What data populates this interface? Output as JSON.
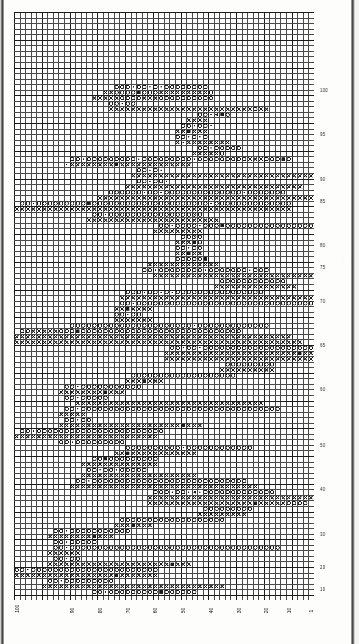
{
  "document": {
    "type": "cross-stitch-chart",
    "title": "Filet crochet / cross stitch pattern chart"
  },
  "chart_data": {
    "type": "heatmap",
    "xlabel": "",
    "ylabel": "",
    "grid": true,
    "legend_position": "none",
    "columns": 54,
    "rows": 106,
    "cell_px": 5.55,
    "bold_every": 5,
    "symbols": {
      "o": "open-circle",
      "x": "cross",
      "f": "filled-square",
      "t": "triangle",
      "d": "dot"
    },
    "colors": {
      "grid_line": "#4a4a4a",
      "grid_line_bold": "#1c1c1c",
      "symbol": "#1a1a1a",
      "paper": "#ffffff"
    },
    "x_ticks": [
      {
        "col": 0,
        "label": "100"
      },
      {
        "col": 10,
        "label": "90"
      },
      {
        "col": 15,
        "label": "80"
      },
      {
        "col": 20,
        "label": "70"
      },
      {
        "col": 25,
        "label": "60"
      },
      {
        "col": 30,
        "label": "50"
      },
      {
        "col": 35,
        "label": "40"
      },
      {
        "col": 40,
        "label": "30"
      },
      {
        "col": 45,
        "label": "20"
      },
      {
        "col": 49,
        "label": "10"
      },
      {
        "col": 53,
        "label": "1"
      }
    ],
    "y_ticks": [
      {
        "row": 14,
        "label": "100"
      },
      {
        "row": 22,
        "label": "95"
      },
      {
        "row": 30,
        "label": "90"
      },
      {
        "row": 34,
        "label": "85"
      },
      {
        "row": 42,
        "label": "80"
      },
      {
        "row": 46,
        "label": "75"
      },
      {
        "row": 52,
        "label": "70"
      },
      {
        "row": 60,
        "label": "65"
      },
      {
        "row": 68,
        "label": "60"
      },
      {
        "row": 78,
        "label": "50"
      },
      {
        "row": 86,
        "label": "40"
      },
      {
        "row": 94,
        "label": "30"
      },
      {
        "row": 100,
        "label": "20"
      },
      {
        "row": 104,
        "label": "10"
      }
    ],
    "cells": [
      {
        "r": 13,
        "c": 18,
        "s": "ooo-oo-o-oooooooo"
      },
      {
        "r": 14,
        "c": 16,
        "s": "xxoooofoooxxxxxxxxxo"
      },
      {
        "r": 15,
        "c": 14,
        "s": "xxxxxooooxxxoooooooooo"
      },
      {
        "r": 16,
        "c": 17,
        "s": "oo-oo"
      },
      {
        "r": 17,
        "c": 17,
        "s": "xxxxxxxxxxxxxxxxxxxxxxxxxxoxx"
      },
      {
        "r": 18,
        "c": 33,
        "s": "oo-tfo"
      },
      {
        "r": 19,
        "c": 31,
        "s": "xxxx"
      },
      {
        "r": 20,
        "c": 30,
        "s": "oo-oo-"
      },
      {
        "r": 21,
        "c": 29,
        "s": "xxfxxx"
      },
      {
        "r": 22,
        "c": 29,
        "s": "oo-o-o"
      },
      {
        "r": 23,
        "c": 29,
        "s": "x-xxxxxxxx"
      },
      {
        "r": 24,
        "c": 33,
        "s": "oo-ooooo"
      },
      {
        "r": 25,
        "c": 32,
        "s": "xxxxxo"
      },
      {
        "r": 26,
        "c": 10,
        "s": "oo-ooooooooo-ooooooooo-oooooooooxxxooofo"
      },
      {
        "r": 27,
        "c": 9,
        "s": "-xxxxxxxxfxxxxxxxxxxxxx"
      },
      {
        "r": 28,
        "c": 22,
        "s": "oo-o-"
      },
      {
        "r": 29,
        "c": 21,
        "s": "xxxxxxxxxxxxxxxxxxxxxxxxxxxxxxxxx"
      },
      {
        "r": 30,
        "c": 22,
        "s": "oo-oo-"
      },
      {
        "r": 31,
        "c": 20,
        "s": "xxxxxxxxxxxxxxxxxxxxxxxxxxxxxxxx"
      },
      {
        "r": 32,
        "c": 17,
        "s": "oooooo-oo-oooooooooooooo-ooooooo"
      },
      {
        "r": 33,
        "c": 15,
        "s": "xxxxxxxxxxxxxxxxxxxxxxxxxxxxxxxxxxxxxxxxx"
      },
      {
        "r": 34,
        "c": 1,
        "s": "oo-ooooooooofooooooooooooooooooooo-oooooooooooooo"
      },
      {
        "r": 35,
        "c": 0,
        "s": "xxxxxxxxxxxxxxxxxxxxxxxxxxxxxxxxxxxxxxxxxxxxxxxxxx"
      },
      {
        "r": 36,
        "c": 14,
        "s": "oo-ooooooooooooooouo"
      },
      {
        "r": 37,
        "c": 13,
        "s": "xxxxxxxxxxxxxxxxxxxxxxxx"
      },
      {
        "r": 38,
        "c": 26,
        "s": "oo-oooo-ooofooooooooooooooooofooo"
      },
      {
        "r": 39,
        "c": 25,
        "s": "xxxxxxxxx"
      },
      {
        "r": 40,
        "c": 30,
        "s": "oouo"
      },
      {
        "r": 41,
        "c": 29,
        "s": "xxxfo"
      },
      {
        "r": 42,
        "c": 29,
        "s": "oo-oo"
      },
      {
        "r": 43,
        "c": 29,
        "s": "xxfxx"
      },
      {
        "r": 44,
        "c": 29,
        "s": "ooooof"
      },
      {
        "r": 45,
        "c": 24,
        "s": "xxxxxxxxxxxxx"
      },
      {
        "r": 46,
        "c": 23,
        "s": "oo-oooooooo-ooooooo-ooo"
      },
      {
        "r": 47,
        "c": 25,
        "s": "xxxxxxxxxxxxxxxxxxxxxxxxxxxxxx"
      },
      {
        "r": 48,
        "c": 37,
        "s": "oooooooooooo"
      },
      {
        "r": 49,
        "c": 36,
        "s": "xxxxxxxxxxxxxxx"
      },
      {
        "r": 50,
        "c": 20,
        "s": "ooo-oo-o-oooooooooooooooo"
      },
      {
        "r": 51,
        "c": 19,
        "s": "xxxxxxxxxxxxxxxxxxxxxxxxxxxxxxxxxxxxxxxxxxxxxxx"
      },
      {
        "r": 52,
        "c": 19,
        "s": "oo-oooooooooooooooooooooooooooooooooooooooooo"
      },
      {
        "r": 53,
        "c": 18,
        "s": "xxfxxxx"
      },
      {
        "r": 54,
        "c": 18,
        "s": "oo-oo"
      },
      {
        "r": 55,
        "c": 18,
        "s": "xxxxxxx"
      },
      {
        "r": 56,
        "c": 10,
        "s": "oooooooooooooooooooooo-ooooooooooooo"
      },
      {
        "r": 57,
        "c": 1,
        "s": "ooxxxxxooofooooooooooooooooooooooooooooo"
      },
      {
        "r": 58,
        "c": 0,
        "s": "xxxxxxxxxxxxxxxxxxxxxxxxxxxxxxxxxxxxxxxxxxxxxxxxxx"
      },
      {
        "r": 59,
        "c": 0,
        "s": "xxxxxxxxxxxxxxxxxxxxxxxxxxxxxxxxxxxxxxxxxxxxxxxxxxxx"
      },
      {
        "r": 60,
        "c": 28,
        "s": "oo-oo-ooooooooooooooooooooooooo-ooo"
      },
      {
        "r": 61,
        "c": 27,
        "s": "xxxxxxxxxxxxxxxxxxxxxxxxfxxxxxo"
      },
      {
        "r": 62,
        "c": 27,
        "s": "xxxxxxxxxxxxxxxxxxxxxxxxxxxxx"
      },
      {
        "r": 63,
        "c": 38,
        "s": "ooooooooo"
      },
      {
        "r": 64,
        "c": 37,
        "s": "xxxxxxxxxx"
      },
      {
        "r": 65,
        "c": 21,
        "s": "ooooooooooooooooooo"
      },
      {
        "r": 66,
        "c": 20,
        "s": "xxxfxxx"
      },
      {
        "r": 67,
        "c": 9,
        "s": "oo-ooooooooooo"
      },
      {
        "r": 68,
        "c": 8,
        "s": "xxxxxxxxfxxx"
      },
      {
        "r": 69,
        "c": 9,
        "s": "oo-ooooo"
      },
      {
        "r": 70,
        "c": 11,
        "s": "xxxxxxxxxxxxxxxxxxxxxxxxxxxxxxxxxx"
      },
      {
        "r": 71,
        "c": 9,
        "s": "oo-oooooooooooooooooooooooooooooooooooo"
      },
      {
        "r": 72,
        "c": 8,
        "s": "xxxxx"
      },
      {
        "r": 73,
        "c": 9,
        "s": "oo-oo"
      },
      {
        "r": 74,
        "c": 8,
        "s": "xxxxxxxxxxxxxxxxxxxxxxfxxx"
      },
      {
        "r": 75,
        "c": 1,
        "s": "oo-ooooooooooooooooooooooo"
      },
      {
        "r": 76,
        "c": 0,
        "s": "xxxxxxxxxxxxxxxxxxxxxxxxxx"
      },
      {
        "r": 77,
        "c": 8,
        "s": "oo-ooooooooo"
      },
      {
        "r": 78,
        "c": 20,
        "s": "oooooooooo-oooooooooooo"
      },
      {
        "r": 79,
        "c": 18,
        "s": "xxfxxxxxxxxxxxx"
      },
      {
        "r": 80,
        "c": 14,
        "s": "oofooooooooo"
      },
      {
        "r": 81,
        "c": 12,
        "s": "xxxxxxxxxxxxxx"
      },
      {
        "r": 82,
        "c": 13,
        "s": "oo-oo-ooooo"
      },
      {
        "r": 83,
        "c": 12,
        "s": "xxxxxxxxxxxxxxxxxxxxx"
      },
      {
        "r": 84,
        "c": 11,
        "s": "oo-oooooooooooooooooooooooooooo"
      },
      {
        "r": 85,
        "c": 10,
        "s": "xxxxxxxxxxxxxxxxxxxxxxxxxxxxxxxxxx"
      },
      {
        "r": 86,
        "c": 25,
        "s": "ooo-oo-t-ooooooooooooo"
      },
      {
        "r": 87,
        "c": 24,
        "s": "xxxxxxxxxxxxxxxxxxxxxxxxxxxxxx"
      },
      {
        "r": 88,
        "c": 24,
        "s": "xxxxxxxxxxxxxxxxxxxfxxxxxoooo"
      },
      {
        "r": 89,
        "c": 34,
        "s": "ooooooooo"
      },
      {
        "r": 90,
        "c": 33,
        "s": "xxxxxxxxx"
      },
      {
        "r": 91,
        "c": 19,
        "s": "ooooooooooooooooooo"
      },
      {
        "r": 92,
        "c": 18,
        "s": "xxxfxxx"
      },
      {
        "r": 93,
        "c": 7,
        "s": "oo-ooooooooooo"
      },
      {
        "r": 94,
        "c": 6,
        "s": "xxxxxxxxfxxx"
      },
      {
        "r": 95,
        "c": 7,
        "s": "oo-ooooo"
      },
      {
        "r": 96,
        "c": 7,
        "s": "oo-oooooooooooooooooooooooooooooooooooooo"
      },
      {
        "r": 97,
        "c": 6,
        "s": "xxxxxx"
      },
      {
        "r": 98,
        "c": 7,
        "s": "oo-oo"
      },
      {
        "r": 99,
        "c": 6,
        "s": "xxxxxxxxxxxxxxxxxxxxxxfxxx"
      },
      {
        "r": 100,
        "c": 0,
        "s": "oo-ooooooooooooooooooooooo"
      },
      {
        "r": 101,
        "c": 0,
        "s": "xxxxxxxxxxxxxxxxxxfxxxxxxx"
      },
      {
        "r": 102,
        "c": 6,
        "s": "oo-ooooooooo"
      },
      {
        "r": 103,
        "c": 5,
        "s": "xxxxxxxxxxxxxxxxxxxxxxxxxxxxxxxxx"
      },
      {
        "r": 104,
        "c": 14,
        "s": "oo-ooooooooofoooooo"
      }
    ]
  },
  "margin_notes": [
    "···",
    "··",
    "···",
    "··",
    "···"
  ]
}
